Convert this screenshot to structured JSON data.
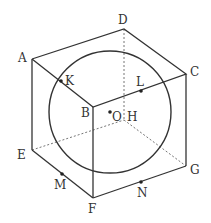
{
  "diagram": {
    "vertices": {
      "A": {
        "label": "A",
        "x": 32,
        "y": 59
      },
      "B": {
        "label": "B",
        "x": 93,
        "y": 107
      },
      "C": {
        "label": "C",
        "x": 186,
        "y": 74
      },
      "D": {
        "label": "D",
        "x": 124,
        "y": 29
      },
      "E": {
        "label": "E",
        "x": 32,
        "y": 150
      },
      "F": {
        "label": "F",
        "x": 93,
        "y": 198
      },
      "G": {
        "label": "G",
        "x": 186,
        "y": 166
      },
      "H": {
        "label": "H",
        "x": 124,
        "y": 120
      }
    },
    "points": {
      "K": {
        "label": "K",
        "x": 61,
        "y": 81
      },
      "L": {
        "label": "L",
        "x": 141,
        "y": 91
      },
      "O": {
        "label": "O",
        "x": 110,
        "y": 112
      },
      "M": {
        "label": "M",
        "x": 62,
        "y": 174
      },
      "N": {
        "label": "N",
        "x": 141,
        "y": 182
      }
    },
    "sphere": {
      "center_label": "O",
      "cx": 110,
      "cy": 112,
      "r": 61
    }
  }
}
